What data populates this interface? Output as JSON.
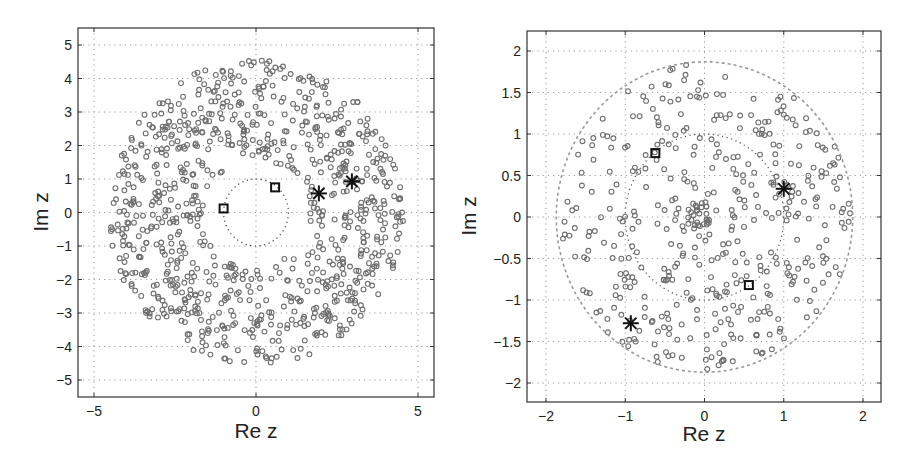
{
  "chart_data": [
    {
      "type": "scatter",
      "title": "",
      "xlabel": "Re z",
      "ylabel": "Im z",
      "xlim": [
        -5.5,
        5.55
      ],
      "ylim": [
        -5.5,
        5.5
      ],
      "xticks": [
        -5,
        0,
        5
      ],
      "yticks": [
        -5,
        -4,
        -3,
        -2,
        -1,
        0,
        1,
        2,
        3,
        4,
        5
      ],
      "grid": true,
      "legend": null,
      "series": [
        {
          "name": "eigenvalues",
          "marker": "circle",
          "color": "#6e6e6e",
          "distribution": "annulus",
          "r_inner": 1.6,
          "r_outer": 4.55,
          "count": 900,
          "seed": 11
        },
        {
          "name": "unit-circle",
          "marker": "dotted-line",
          "color": "#444444",
          "radius": 1.0
        }
      ],
      "highlighted": {
        "squares": [
          {
            "re": -1.0,
            "im": 0.12
          },
          {
            "re": 0.59,
            "im": 0.75
          }
        ],
        "stars": [
          {
            "re": 1.94,
            "im": 0.57
          },
          {
            "re": 2.96,
            "im": 0.93
          }
        ]
      },
      "frame": {
        "left": 78,
        "top": 28,
        "right": 434,
        "bottom": 397,
        "x0px": 256,
        "xscale": 32.4,
        "y0px": 212.5,
        "yscale": 33.5
      }
    },
    {
      "type": "scatter",
      "title": "",
      "xlabel": "Re z",
      "ylabel": "Im z",
      "xlim": [
        -2.25,
        2.22
      ],
      "ylim": [
        -2.25,
        2.2
      ],
      "xticks": [
        -2,
        -1,
        0,
        1,
        2
      ],
      "yticks": [
        -2,
        -1.5,
        -1,
        -0.5,
        0,
        0.5,
        1,
        1.5,
        2
      ],
      "grid": true,
      "legend": null,
      "series": [
        {
          "name": "eigenvalues",
          "marker": "circle",
          "color": "#6e6e6e",
          "distribution": "disk",
          "r_inner": 0.0,
          "r_outer": 1.85,
          "count": 430,
          "seed": 23
        },
        {
          "name": "center-cluster",
          "marker": "circle",
          "color": "#6e6e6e",
          "distribution": "disk",
          "r_inner": 0.0,
          "r_outer": 0.18,
          "count": 22,
          "seed": 5
        },
        {
          "name": "rim-circle",
          "marker": "dashed-line",
          "color": "#999999",
          "radius": 1.87
        },
        {
          "name": "unit-circle",
          "marker": "dotted-line",
          "color": "#555555",
          "radius": 1.0
        }
      ],
      "highlighted": {
        "squares": [
          {
            "re": -0.62,
            "im": 0.77
          },
          {
            "re": 0.56,
            "im": -0.82
          }
        ],
        "stars": [
          {
            "re": 1.0,
            "im": 0.34
          },
          {
            "re": -0.93,
            "im": -1.28
          }
        ]
      },
      "frame": {
        "left": 527,
        "top": 31,
        "right": 881,
        "bottom": 402,
        "x0px": 704.5,
        "xscale": 79.25,
        "y0px": 217,
        "yscale": 83
      }
    }
  ],
  "labels": {
    "left": {
      "xlabel": "Re z",
      "ylabel": "Im z",
      "xticklabels": [
        "-5",
        "0",
        "5"
      ],
      "yticklabels": [
        "5",
        "4",
        "3",
        "2",
        "1",
        "0",
        "-1",
        "-2",
        "-3",
        "-4",
        "-5"
      ]
    },
    "right": {
      "xlabel": "Re z",
      "ylabel": "Im z",
      "xticklabels": [
        "-2",
        "-1",
        "0",
        "1",
        "2"
      ],
      "yticklabels": [
        "2",
        "1.5",
        "1",
        "0.5",
        "0",
        "-0.5",
        "-1",
        "-1.5",
        "-2"
      ]
    }
  }
}
